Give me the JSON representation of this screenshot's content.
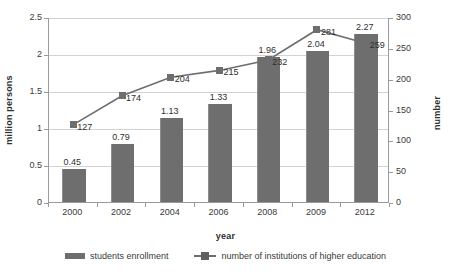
{
  "chart_data": {
    "type": "bar",
    "title": "",
    "subtitle": "",
    "xlabel": "year",
    "ylabel": "million persons",
    "y2label": "number",
    "categories": [
      "2000",
      "2002",
      "2004",
      "2006",
      "2008",
      "2009",
      "2012"
    ],
    "ylim": [
      0,
      2.5
    ],
    "y2lim": [
      0,
      300
    ],
    "yticks": [
      "0",
      "0.5",
      "1",
      "1.5",
      "2",
      "2.5"
    ],
    "ytick_values": [
      0,
      0.5,
      1,
      1.5,
      2,
      2.5
    ],
    "y2ticks": [
      "0",
      "50",
      "100",
      "150",
      "200",
      "250",
      "300"
    ],
    "y2tick_values": [
      0,
      50,
      100,
      150,
      200,
      250,
      300
    ],
    "grid": true,
    "legend_position": "bottom",
    "series": [
      {
        "name": "students enrollment",
        "type": "bar",
        "axis": "left",
        "color": "#6e6e6e",
        "values": [
          0.45,
          0.79,
          1.13,
          1.33,
          1.96,
          2.04,
          2.27
        ],
        "labels": [
          "0.45",
          "0.79",
          "1.13",
          "1.33",
          "1.96",
          "2.04",
          "2.27"
        ]
      },
      {
        "name": "number of institutions of higher education",
        "type": "line",
        "axis": "right",
        "color": "#6e6e6e",
        "marker": "square",
        "values": [
          127,
          174,
          204,
          215,
          232,
          281,
          259
        ],
        "labels": [
          "127",
          "174",
          "204",
          "215",
          "232",
          "281",
          "259"
        ]
      }
    ]
  },
  "legend": {
    "bar_label": "students enrollment",
    "line_label": "number of institutions of higher education"
  }
}
